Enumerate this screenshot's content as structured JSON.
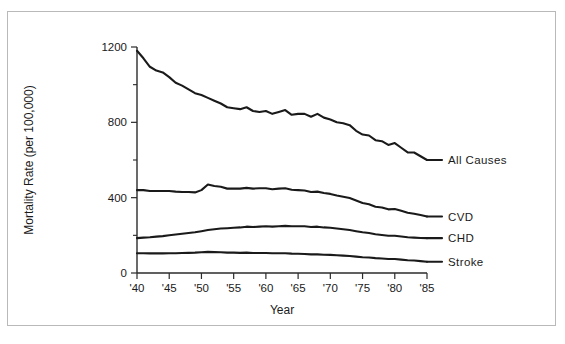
{
  "chart_data": {
    "type": "line",
    "title": "",
    "xlabel": "Year",
    "ylabel": "Mortality Rate (per 100,000)",
    "xlim": [
      1940,
      1985
    ],
    "ylim": [
      0,
      1200
    ],
    "grid": false,
    "legend_position": "right-inline-labels",
    "xtick_labels": [
      "'40",
      "'45",
      "'50",
      "'55",
      "'60",
      "'65",
      "'70",
      "'75",
      "'80",
      "'85"
    ],
    "xticks": [
      1940,
      1945,
      1950,
      1955,
      1960,
      1965,
      1970,
      1975,
      1980,
      1985
    ],
    "ytick_labels": [
      "0",
      "400",
      "800",
      "1200"
    ],
    "yticks": [
      0,
      400,
      800,
      1200
    ],
    "yticks_minor": [
      200,
      600,
      1000
    ],
    "x": [
      1940,
      1941,
      1942,
      1943,
      1944,
      1945,
      1946,
      1947,
      1948,
      1949,
      1950,
      1951,
      1952,
      1953,
      1954,
      1955,
      1956,
      1957,
      1958,
      1959,
      1960,
      1961,
      1962,
      1963,
      1964,
      1965,
      1966,
      1967,
      1968,
      1969,
      1970,
      1971,
      1972,
      1973,
      1974,
      1975,
      1976,
      1977,
      1978,
      1979,
      1980,
      1981,
      1982,
      1983,
      1984,
      1985
    ],
    "series": [
      {
        "name": "All Causes",
        "label": "All Causes",
        "color": "#1a1a1a",
        "values": [
          1180,
          1140,
          1095,
          1075,
          1065,
          1040,
          1010,
          995,
          975,
          955,
          945,
          930,
          915,
          900,
          880,
          875,
          870,
          880,
          860,
          855,
          860,
          845,
          855,
          865,
          840,
          845,
          845,
          830,
          845,
          825,
          815,
          800,
          795,
          785,
          755,
          735,
          730,
          705,
          700,
          680,
          690,
          665,
          640,
          640,
          620,
          600
        ]
      },
      {
        "name": "CVD",
        "label": "CVD",
        "color": "#1a1a1a",
        "values": [
          440,
          440,
          435,
          435,
          435,
          435,
          432,
          430,
          430,
          428,
          440,
          470,
          462,
          458,
          448,
          448,
          448,
          452,
          448,
          450,
          450,
          445,
          448,
          450,
          442,
          440,
          438,
          430,
          432,
          425,
          420,
          412,
          405,
          398,
          385,
          372,
          365,
          352,
          348,
          338,
          340,
          330,
          320,
          315,
          308,
          300
        ]
      },
      {
        "name": "CHD",
        "label": "CHD",
        "color": "#1a1a1a",
        "values": [
          185,
          188,
          190,
          193,
          196,
          200,
          204,
          208,
          212,
          216,
          222,
          228,
          232,
          236,
          238,
          240,
          242,
          246,
          244,
          246,
          248,
          246,
          248,
          250,
          248,
          248,
          248,
          244,
          246,
          242,
          240,
          236,
          232,
          228,
          222,
          216,
          212,
          206,
          202,
          198,
          198,
          194,
          190,
          188,
          186,
          185
        ]
      },
      {
        "name": "Stroke",
        "label": "Stroke",
        "color": "#1a1a1a",
        "values": [
          105,
          105,
          104,
          104,
          104,
          105,
          105,
          106,
          107,
          108,
          110,
          112,
          111,
          110,
          108,
          108,
          107,
          108,
          106,
          106,
          106,
          105,
          105,
          105,
          103,
          102,
          101,
          99,
          99,
          97,
          96,
          94,
          92,
          90,
          87,
          84,
          82,
          79,
          77,
          74,
          74,
          71,
          68,
          66,
          63,
          60
        ]
      }
    ]
  }
}
